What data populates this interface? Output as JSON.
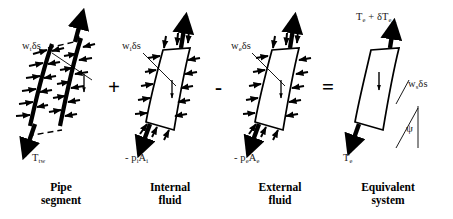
{
  "figure": {
    "type": "force-balance-decomposition-diagram"
  },
  "panels": [
    {
      "id": "pipe-segment",
      "caption_line1": "Pipe",
      "caption_line2": "segment",
      "weight_label": "w",
      "weight_sub": "t",
      "weight_suffix": "δs",
      "tension_label": "T",
      "tension_sub": "tw",
      "top_arrow": "up",
      "bottom_arrow": "down-left",
      "distributed_arrows": "inward-pressure-ticks-both-sides",
      "dashed_cut_marks": true
    },
    {
      "id": "internal-fluid",
      "caption_line1": "Internal",
      "caption_line2": "fluid",
      "weight_label": "w",
      "weight_sub": "i",
      "weight_suffix": "δs",
      "tension_label": "- p",
      "tension_sub": "i",
      "tension_label2": "A",
      "tension_sub2": "i",
      "top_arrow": "up",
      "bottom_arrow": "down-left",
      "distributed_arrows": "outward-pressure-ticks-both-sides"
    },
    {
      "id": "external-fluid",
      "caption_line1": "External",
      "caption_line2": "fluid",
      "weight_label": "w",
      "weight_sub": "e",
      "weight_suffix": "δs",
      "tension_label": "- p",
      "tension_sub": "e",
      "tension_label2": "A",
      "tension_sub2": "e",
      "top_arrow": "up",
      "bottom_arrow": "down-left",
      "distributed_arrows": "inward-pressure-ticks-both-sides"
    },
    {
      "id": "equivalent-system",
      "caption_line1": "Equivalent",
      "caption_line2": "system",
      "top_label": "T",
      "top_sub": "e",
      "top_plus": " + ",
      "top_delta": "δT",
      "top_delta_sub": "e",
      "weight_label": "w",
      "weight_sub": "s",
      "weight_suffix": "δs",
      "tension_label": "T",
      "tension_sub": "e",
      "angle_symbol": "ψ",
      "top_arrow": "up",
      "bottom_arrow": "down-left",
      "distributed_arrows": "none"
    }
  ],
  "operators": [
    {
      "symbol": "+",
      "name": "plus-operator"
    },
    {
      "symbol": "-",
      "name": "minus-operator"
    },
    {
      "symbol": "=",
      "name": "equals-operator"
    }
  ],
  "colors": {
    "stroke": "#000000",
    "background": "#ffffff",
    "text": "#1a1a1a"
  }
}
